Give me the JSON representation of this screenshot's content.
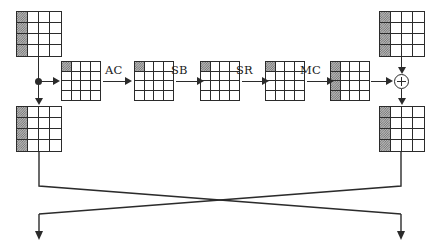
{
  "diagram": {
    "type": "block-diagram",
    "stroke_color": "#2b2b2b",
    "shade_color": "#6f6f6f",
    "background": "#ffffff"
  },
  "operations": [
    {
      "id": "ac",
      "label": "AC",
      "name": "AddConstant"
    },
    {
      "id": "sb",
      "label": "SB",
      "name": "SubBytes"
    },
    {
      "id": "sr",
      "label": "SR",
      "name": "ShiftRows"
    },
    {
      "id": "mc",
      "label": "MC",
      "name": "MixColumns"
    }
  ],
  "states": [
    {
      "id": "top-left-state",
      "rows": 4,
      "cols": 4,
      "shaded": "first-column",
      "size": "large"
    },
    {
      "id": "bottom-left-state",
      "rows": 4,
      "cols": 4,
      "shaded": "first-column",
      "size": "large"
    },
    {
      "id": "pipeline-state-1",
      "rows": 4,
      "cols": 4,
      "shaded": "top-left-cell",
      "size": "small"
    },
    {
      "id": "pipeline-state-2",
      "rows": 4,
      "cols": 4,
      "shaded": "top-left-cell",
      "size": "small"
    },
    {
      "id": "pipeline-state-3",
      "rows": 4,
      "cols": 4,
      "shaded": "top-left-cell",
      "size": "small"
    },
    {
      "id": "pipeline-state-4",
      "rows": 4,
      "cols": 4,
      "shaded": "top-left-cell",
      "size": "small"
    },
    {
      "id": "pipeline-state-5",
      "rows": 4,
      "cols": 4,
      "shaded": "first-column",
      "size": "small"
    },
    {
      "id": "top-right-state",
      "rows": 4,
      "cols": 4,
      "shaded": "first-column",
      "size": "large"
    },
    {
      "id": "bottom-right-state",
      "rows": 4,
      "cols": 4,
      "shaded": "first-column",
      "size": "large"
    }
  ],
  "nodes": [
    {
      "id": "branch-point",
      "symbol": "filled-dot",
      "name": "branch-junction"
    },
    {
      "id": "xor-gate",
      "symbol": "circled-plus",
      "name": "xor-operator"
    }
  ],
  "connections": [
    {
      "id": "conn-topleft-to-branch",
      "from": "top-left-state",
      "to": "branch-point",
      "direction": "down"
    },
    {
      "id": "conn-branch-to-bottomleft",
      "from": "branch-point",
      "to": "bottom-left-state",
      "direction": "down",
      "arrow": true
    },
    {
      "id": "conn-branch-to-pipeline",
      "from": "branch-point",
      "to": "pipeline-state-1",
      "direction": "right",
      "arrow": true
    },
    {
      "id": "conn-mc-to-xor",
      "from": "pipeline-state-5",
      "to": "xor-gate",
      "direction": "right",
      "arrow": true
    },
    {
      "id": "conn-topright-to-xor",
      "from": "top-right-state",
      "to": "xor-gate",
      "direction": "down",
      "arrow": true
    },
    {
      "id": "conn-xor-to-bottomright",
      "from": "xor-gate",
      "to": "bottom-right-state",
      "direction": "down",
      "arrow": true
    },
    {
      "id": "conn-cross-left-to-right",
      "from": "bottom-left-state",
      "to": "bottom-right-output",
      "direction": "cross-down-right",
      "arrow": true
    },
    {
      "id": "conn-cross-right-to-left",
      "from": "bottom-right-state",
      "to": "bottom-left-output",
      "direction": "cross-down-left",
      "arrow": true
    }
  ]
}
